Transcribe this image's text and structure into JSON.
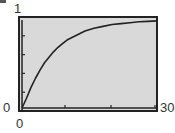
{
  "chart_data": {
    "type": "line",
    "title": "",
    "xlabel": "",
    "ylabel": "",
    "xlim": [
      0,
      30
    ],
    "ylim": [
      0,
      1
    ],
    "x_tick_labels": {
      "min": "0",
      "max": "30"
    },
    "y_tick_labels": {
      "min": "0",
      "max": "1"
    },
    "x_ticks": [
      0,
      10,
      20,
      30
    ],
    "y_ticks": [
      0,
      0.2,
      0.4,
      0.6,
      0.8,
      1
    ],
    "grid": false,
    "legend": null,
    "series": [
      {
        "name": "y = 1 - e^(-0.15x)",
        "x": [
          0,
          1,
          2,
          3,
          4,
          5,
          6,
          7,
          8,
          9,
          10,
          12,
          14,
          16,
          18,
          20,
          22,
          24,
          26,
          28,
          30
        ],
        "values": [
          0,
          0.14,
          0.26,
          0.36,
          0.45,
          0.53,
          0.59,
          0.65,
          0.7,
          0.74,
          0.78,
          0.83,
          0.88,
          0.91,
          0.93,
          0.95,
          0.96,
          0.97,
          0.98,
          0.985,
          0.99
        ]
      }
    ],
    "colors": {
      "background": "#d9d9d9",
      "frame": "#222222",
      "curve": "#222222"
    }
  },
  "labels": {
    "y_max": "1",
    "y_min": "0",
    "x_min": "0",
    "x_max": "30"
  }
}
